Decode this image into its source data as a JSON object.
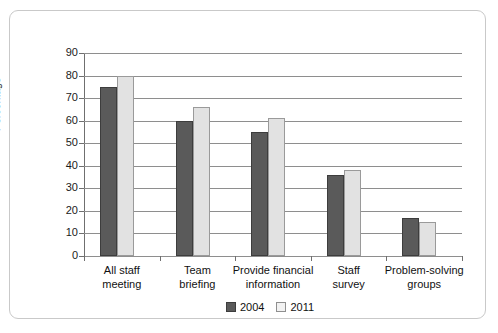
{
  "chart_data": {
    "type": "bar",
    "title": "",
    "xlabel": "",
    "ylabel": "Percentage",
    "ylim": [
      0,
      90
    ],
    "yticks": [
      0,
      10,
      20,
      30,
      40,
      50,
      60,
      70,
      80,
      90
    ],
    "ytick_labels": [
      "0",
      "10",
      "20",
      "30",
      "40",
      "50",
      "60",
      "70",
      "80",
      "90"
    ],
    "grid": true,
    "legend_position": "bottom",
    "categories": [
      "All staff meeting",
      "Team briefing",
      "Provide financial information",
      "Staff survey",
      "Problem-solving groups"
    ],
    "category_lines": [
      [
        "All staff",
        "meeting"
      ],
      [
        "Team",
        "briefing"
      ],
      [
        "Provide financial",
        "information"
      ],
      [
        "Staff",
        "survey"
      ],
      [
        "Problem-solving",
        "groups"
      ]
    ],
    "series": [
      {
        "name": "2004",
        "color": "#5a5a5a",
        "values": [
          75,
          60,
          55,
          36,
          17
        ]
      },
      {
        "name": "2011",
        "color": "#e2e2e2",
        "values": [
          80,
          66,
          61,
          38,
          15
        ]
      }
    ]
  },
  "legend": {
    "items": [
      {
        "label": "2004"
      },
      {
        "label": "2011"
      }
    ]
  }
}
